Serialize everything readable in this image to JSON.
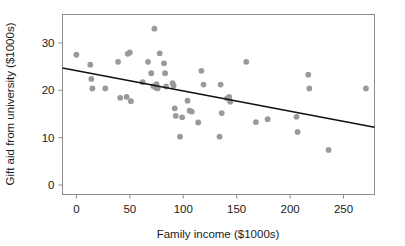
{
  "chart_data": {
    "type": "scatter",
    "title": "",
    "xlabel": "Family income ($1000s)",
    "ylabel": "Gift aid from university ($1000s)",
    "xlim": [
      -13,
      279
    ],
    "ylim": [
      -2,
      36
    ],
    "xticks": [
      0,
      50,
      100,
      150,
      200,
      250
    ],
    "xtick_labels": [
      "0",
      "50",
      "100",
      "150",
      "200",
      "250"
    ],
    "yticks": [
      0,
      10,
      20,
      30
    ],
    "ytick_labels": [
      "0",
      "10",
      "20",
      "30"
    ],
    "grid": false,
    "legend": "none",
    "point_color": "#9a9a9a",
    "line_color": "#111111",
    "frame_color": "#8d8d8d",
    "points": [
      {
        "x": 0,
        "y": 27.5
      },
      {
        "x": 13,
        "y": 25.4
      },
      {
        "x": 14,
        "y": 22.4
      },
      {
        "x": 15,
        "y": 20.4
      },
      {
        "x": 27,
        "y": 20.4
      },
      {
        "x": 39,
        "y": 26.0
      },
      {
        "x": 41,
        "y": 18.4
      },
      {
        "x": 47,
        "y": 18.6
      },
      {
        "x": 48,
        "y": 27.7
      },
      {
        "x": 50,
        "y": 28.0
      },
      {
        "x": 51,
        "y": 17.7
      },
      {
        "x": 62,
        "y": 21.7
      },
      {
        "x": 67,
        "y": 26.0
      },
      {
        "x": 70,
        "y": 23.6
      },
      {
        "x": 72,
        "y": 20.9
      },
      {
        "x": 73,
        "y": 33.0
      },
      {
        "x": 74,
        "y": 20.6
      },
      {
        "x": 75,
        "y": 21.3
      },
      {
        "x": 76,
        "y": 20.4
      },
      {
        "x": 78,
        "y": 27.8
      },
      {
        "x": 82,
        "y": 25.7
      },
      {
        "x": 83,
        "y": 23.6
      },
      {
        "x": 84,
        "y": 20.8
      },
      {
        "x": 90,
        "y": 21.5
      },
      {
        "x": 91,
        "y": 21.0
      },
      {
        "x": 92,
        "y": 16.2
      },
      {
        "x": 93,
        "y": 14.6
      },
      {
        "x": 97,
        "y": 10.2
      },
      {
        "x": 99,
        "y": 14.3
      },
      {
        "x": 104,
        "y": 17.8
      },
      {
        "x": 106,
        "y": 15.7
      },
      {
        "x": 108,
        "y": 15.5
      },
      {
        "x": 114,
        "y": 13.2
      },
      {
        "x": 117,
        "y": 24.1
      },
      {
        "x": 119,
        "y": 21.2
      },
      {
        "x": 134,
        "y": 10.2
      },
      {
        "x": 135,
        "y": 21.2
      },
      {
        "x": 136,
        "y": 15.2
      },
      {
        "x": 141,
        "y": 18.3
      },
      {
        "x": 143,
        "y": 18.6
      },
      {
        "x": 144,
        "y": 17.6
      },
      {
        "x": 159,
        "y": 26.0
      },
      {
        "x": 168,
        "y": 13.3
      },
      {
        "x": 179,
        "y": 13.9
      },
      {
        "x": 206,
        "y": 14.4
      },
      {
        "x": 207,
        "y": 11.2
      },
      {
        "x": 217,
        "y": 23.3
      },
      {
        "x": 218,
        "y": 20.4
      },
      {
        "x": 236,
        "y": 7.4
      },
      {
        "x": 271,
        "y": 20.4
      }
    ],
    "fit_line": {
      "label": "least-squares regression line",
      "x_start": -13,
      "y_start": 24.7,
      "x_end": 279,
      "y_end": 12.2
    }
  }
}
